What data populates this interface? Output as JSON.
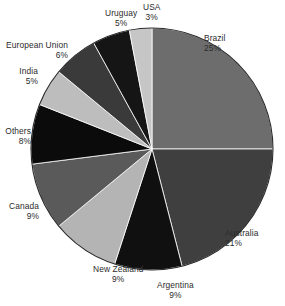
{
  "chart_data": {
    "type": "pie",
    "title": "",
    "subtitle": "",
    "xlabel": "",
    "ylabel": "",
    "legend_position": "outside-labels",
    "grid": false,
    "start_angle_deg": 0,
    "direction": "clockwise",
    "categories": [
      "Brazil",
      "Australia",
      "Argentina",
      "New Zealand",
      "Canada",
      "Others",
      "India",
      "European Union",
      "Uruguay",
      "USA"
    ],
    "values": [
      25,
      21,
      9,
      9,
      9,
      8,
      5,
      6,
      5,
      3
    ],
    "unit": "%",
    "slices": [
      {
        "label": "Brazil",
        "value": 25,
        "pct_text": "25%",
        "color": "#6d6d6d",
        "side": "right",
        "label_x": 204,
        "label_y": 33
      },
      {
        "label": "Australia",
        "value": 21,
        "pct_text": "21%",
        "color": "#3f3f3f",
        "side": "right",
        "label_x": 225,
        "label_y": 228
      },
      {
        "label": "Argentina",
        "value": 9,
        "pct_text": "9%",
        "color": "#101010",
        "side": "center",
        "label_x": 157,
        "label_y": 280
      },
      {
        "label": "New Zealand",
        "value": 9,
        "pct_text": "9%",
        "color": "#b4b4b4",
        "side": "center",
        "label_x": 93,
        "label_y": 264
      },
      {
        "label": "Canada",
        "value": 9,
        "pct_text": "9%",
        "color": "#5a5a5a",
        "side": "left",
        "label_x": 39,
        "label_y": 201
      },
      {
        "label": "Others",
        "value": 8,
        "pct_text": "8%",
        "color": "#0b0b0b",
        "side": "left",
        "label_x": 31,
        "label_y": 126
      },
      {
        "label": "India",
        "value": 5,
        "pct_text": "5%",
        "color": "#bdbdbd",
        "side": "left",
        "label_x": 38,
        "label_y": 66
      },
      {
        "label": "European Union",
        "value": 6,
        "pct_text": "6%",
        "color": "#3a3a3a",
        "side": "left",
        "label_x": 68,
        "label_y": 40
      },
      {
        "label": "Uruguay",
        "value": 5,
        "pct_text": "5%",
        "color": "#151515",
        "side": "center",
        "label_x": 105,
        "label_y": 8
      },
      {
        "label": "USA",
        "value": 3,
        "pct_text": "3%",
        "color": "#c6c6c6",
        "side": "center",
        "label_x": 143,
        "label_y": 2
      }
    ],
    "geometry": {
      "cx": 152,
      "cy": 149,
      "r": 121
    },
    "colors": {
      "background": "#ffffff",
      "text": "#2b2b2b",
      "outline": "#2a2a2a",
      "divider": "#ffffff"
    }
  },
  "footer": {
    "mark": ""
  }
}
